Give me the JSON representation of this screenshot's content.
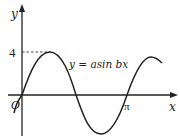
{
  "figure": {
    "type": "function-graph",
    "equation_label": "y = asin bx",
    "axes": {
      "x_label": "x",
      "y_label": "y",
      "origin_label": "O",
      "x_tick_label": "π",
      "y_tick_label": "4"
    },
    "curve": {
      "function": "y = a sin(bx)",
      "amplitude": 4,
      "zero_at": "π",
      "color": "#222222"
    },
    "colors": {
      "axis": "#222222",
      "curve": "#222222",
      "dashed_guide": "#333333",
      "background": "#ffffff"
    }
  }
}
